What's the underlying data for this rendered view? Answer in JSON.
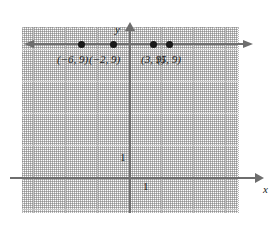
{
  "chart_data": {
    "type": "scatter",
    "title": "",
    "xlabel": "x",
    "ylabel": "y",
    "xlim": [
      -7,
      7
    ],
    "ylim": [
      -5,
      11
    ],
    "grid": true,
    "grid_major_step": 2,
    "grid_minor_step": 0.5,
    "legend": "none",
    "line": {
      "equation": "y = 9",
      "description": "horizontal line through all four points, arrowheads at both ends",
      "y_value": 9,
      "color": "#6e6e6e"
    },
    "points": [
      {
        "label": "(−6, 9)",
        "x": -6,
        "y": 9
      },
      {
        "label": "(−2, 9)",
        "x": -2,
        "y": 9
      },
      {
        "label": "(3, 9)",
        "x": 3,
        "y": 9
      },
      {
        "label": "(5, 9)",
        "x": 5,
        "y": 9
      }
    ],
    "axis_ticks": {
      "x_tick_label": "1",
      "y_tick_label": "1"
    },
    "axis_names": {
      "x": "x",
      "y": "y"
    },
    "colors": {
      "axis": "#6e6e6e",
      "point": "#1a1a1a",
      "major_grid": "#c4c4c4",
      "minor_grid": "#b9b9b9",
      "background": "#ffffff"
    }
  }
}
